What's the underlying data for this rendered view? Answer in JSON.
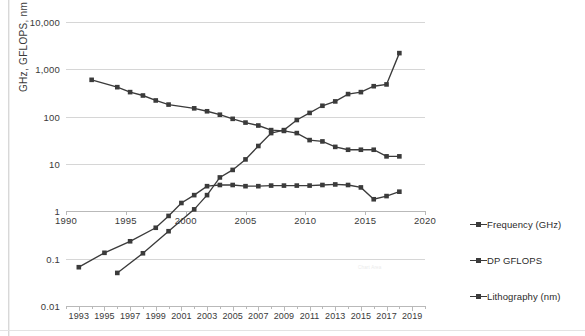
{
  "chart_data": {
    "type": "line",
    "title": "",
    "subtitle": "",
    "xlabel": "",
    "ylabel": "GHz, GFLOPS, nm",
    "yscale": "log",
    "ylim": [
      0.01,
      10000
    ],
    "ytick_labels": [
      "10,000",
      "1,000",
      "100",
      "10",
      "1",
      "0.1",
      "0.01"
    ],
    "ytick_values": [
      10000,
      1000,
      100,
      10,
      1,
      0.1,
      0.01
    ],
    "grid": true,
    "legend_position": "right",
    "secondary_axis": {
      "name": "middle-year-axis",
      "tick_labels": [
        "1990",
        "1995",
        "2000",
        "2005",
        "2010",
        "2015",
        "2020"
      ],
      "tick_values": [
        1990,
        1995,
        2000,
        2005,
        2010,
        2015,
        2020
      ],
      "range": [
        1990,
        2020
      ]
    },
    "primary_axis": {
      "name": "bottom-year-axis",
      "tick_labels": [
        "1993",
        "1995",
        "1997",
        "1999",
        "2001",
        "2003",
        "2005",
        "2007",
        "2009",
        "2011",
        "2013",
        "2015",
        "2017",
        "2019"
      ],
      "tick_values": [
        1993,
        1995,
        1997,
        1999,
        2001,
        2003,
        2005,
        2007,
        2009,
        2011,
        2013,
        2015,
        2017,
        2019
      ],
      "range": [
        1992,
        2020
      ]
    },
    "series": [
      {
        "name": "Frequency (GHz)",
        "x": [
          1993,
          1995,
          1997,
          1999,
          2000,
          2001,
          2002,
          2003,
          2004,
          2005,
          2006,
          2007,
          2008,
          2009,
          2010,
          2011,
          2012,
          2013,
          2014,
          2015,
          2016,
          2017,
          2018
        ],
        "values": [
          0.066,
          0.133,
          0.233,
          0.45,
          0.8,
          1.5,
          2.2,
          3.4,
          3.6,
          3.6,
          3.4,
          3.4,
          3.5,
          3.5,
          3.5,
          3.5,
          3.6,
          3.7,
          3.6,
          3.2,
          1.8,
          2.1,
          2.6
        ]
      },
      {
        "name": "DP GFLOPS",
        "x": [
          1996,
          1998,
          2000,
          2002,
          2003,
          2004,
          2005,
          2006,
          2007,
          2008,
          2009,
          2010,
          2011,
          2012,
          2013,
          2014,
          2015,
          2016,
          2017,
          2018
        ],
        "values": [
          0.05,
          0.13,
          0.38,
          1.1,
          2.2,
          5.2,
          7.5,
          12.5,
          24,
          45,
          52,
          85,
          120,
          170,
          210,
          300,
          330,
          440,
          480,
          2200
        ]
      },
      {
        "name": "Lithography (nm)",
        "x": [
          1994,
          1996,
          1997,
          1998,
          1999,
          2000,
          2002,
          2003,
          2004,
          2005,
          2006,
          2007,
          2008,
          2009,
          2010,
          2011,
          2012,
          2013,
          2014,
          2015,
          2016,
          2017,
          2018
        ],
        "values": [
          600,
          420,
          330,
          280,
          220,
          180,
          150,
          130,
          110,
          90,
          75,
          65,
          52,
          50,
          45,
          32,
          30,
          23,
          20,
          20,
          20,
          14.5,
          14.5
        ]
      }
    ],
    "annotations": [
      {
        "name": "chart-area-watermark",
        "text": "Chart Area"
      }
    ]
  },
  "legend": {
    "items": [
      {
        "label": "Frequency (GHz)",
        "marker": "square-line-marker"
      },
      {
        "label": "DP GFLOPS",
        "marker": "square-line-marker"
      },
      {
        "label": "Lithography (nm)",
        "marker": "square-line-marker"
      }
    ]
  },
  "colors": {
    "series": "#3b3b3b",
    "grid": "#d6d6d6",
    "axis": "#b9b9b9",
    "text": "#2b2b2b",
    "background": "#ffffff"
  }
}
